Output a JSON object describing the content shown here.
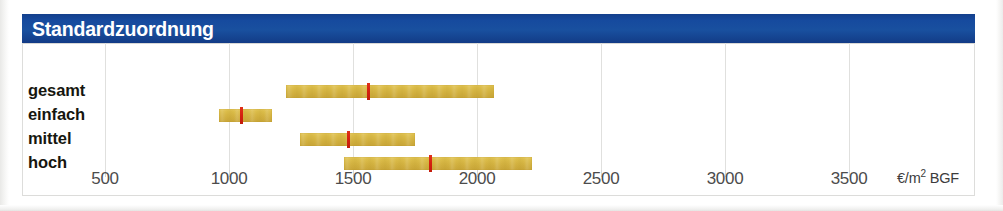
{
  "header": {
    "title": "Standardzuordnung",
    "bar_color": "#16499c",
    "text_color": "#ffffff"
  },
  "chart_data": {
    "type": "bar",
    "title": "Standardzuordnung",
    "xlabel": "€/m² BGF",
    "ylabel": "",
    "orientation": "horizontal",
    "style": "range-bar-with-median-marker",
    "grid": true,
    "legend": null,
    "xlim": [
      0,
      3800
    ],
    "xticks": [
      500,
      1000,
      1500,
      2000,
      2500,
      3000,
      3500
    ],
    "xtick_labels": [
      "500",
      "1000",
      "1500",
      "2000",
      "2500",
      "3000",
      "3500"
    ],
    "axis_unit": "€/m² BGF",
    "unit_prefix": "€/m",
    "unit_sup": "2",
    "unit_suffix": "BGF",
    "categories": [
      "gesamt",
      "einfach",
      "mittel",
      "hoch"
    ],
    "bar_color": "#d8bd4b",
    "marker_color": "#d4200f",
    "series": [
      {
        "name": "gesamt",
        "low": 1230,
        "high": 2070,
        "marker": 1560
      },
      {
        "name": "einfach",
        "low": 960,
        "high": 1175,
        "marker": 1050
      },
      {
        "name": "mittel",
        "low": 1285,
        "high": 1750,
        "marker": 1480
      },
      {
        "name": "hoch",
        "low": 1465,
        "high": 2220,
        "marker": 1810
      }
    ]
  },
  "labels": {
    "gesamt": "gesamt",
    "einfach": "einfach",
    "mittel": "mittel",
    "hoch": "hoch"
  },
  "ticks": {
    "t500": "500",
    "t1000": "1000",
    "t1500": "1500",
    "t2000": "2000",
    "t2500": "2500",
    "t3000": "3000",
    "t3500": "3500"
  }
}
